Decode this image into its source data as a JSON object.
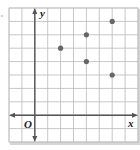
{
  "figure": {
    "type": "coordinate-plane-scatter",
    "x_axis_label": "x",
    "y_axis_label": "y",
    "origin_label": "O",
    "grid": {
      "x_min": -2,
      "x_max": 8,
      "y_min": -2,
      "y_max": 8,
      "gridlines": true
    },
    "points": [
      {
        "x": 2,
        "y": 5
      },
      {
        "x": 4,
        "y": 6
      },
      {
        "x": 4,
        "y": 4
      },
      {
        "x": 6,
        "y": 7
      },
      {
        "x": 6,
        "y": 3
      }
    ],
    "colors": {
      "grid": "#b9b9b9",
      "axis": "#555555",
      "point": "#666666",
      "frame_shadow": "#9a9a9a"
    }
  }
}
